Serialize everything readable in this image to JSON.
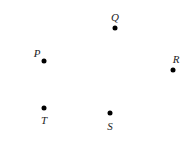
{
  "points": [
    {
      "label": "Q",
      "x": 115,
      "y": 28,
      "lx": 115,
      "ly": 17
    },
    {
      "label": "P",
      "x": 44,
      "y": 61,
      "lx": 37,
      "ly": 53
    },
    {
      "label": "R",
      "x": 173,
      "y": 70,
      "lx": 176,
      "ly": 59
    },
    {
      "label": "T",
      "x": 44,
      "y": 108,
      "lx": 44,
      "ly": 120
    },
    {
      "label": "S",
      "x": 110,
      "y": 113,
      "lx": 110,
      "ly": 126
    }
  ]
}
